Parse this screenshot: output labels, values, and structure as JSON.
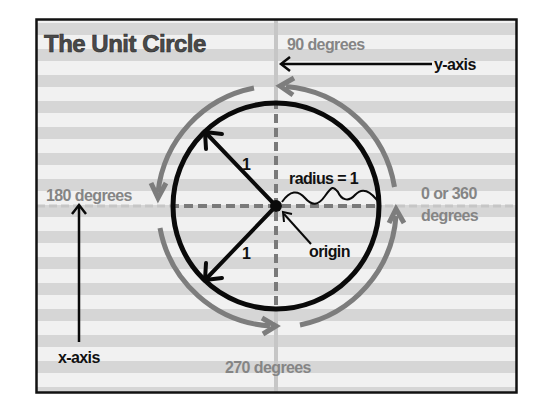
{
  "title": "The Unit Circle",
  "labels": {
    "deg90": "90 degrees",
    "deg180": "180 degrees",
    "deg270": "270 degrees",
    "deg0_line1": "0 or 360",
    "deg0_line2": "degrees",
    "y_axis": "y-axis",
    "x_axis": "x-axis",
    "radius": "radius = 1",
    "origin": "origin",
    "radius_value_upper": "1",
    "radius_value_lower": "1"
  },
  "colors": {
    "stripe_light": "#f1f1f1",
    "stripe_dark": "#d6d6d6",
    "frame": "#111111",
    "circle": "#0a0a0a",
    "gray_arc": "#7d7d7d",
    "gray_text": "#858585",
    "title_text": "#4a4a4a",
    "axis_inner_dash": "#7a7a7a",
    "axis_outer": "#c4c4c4"
  },
  "diagram": {
    "unit_radius": 1,
    "radius_arrow_angles_deg": [
      135,
      225
    ],
    "rotation_direction": "counterclockwise",
    "angle_markers_deg": [
      0,
      90,
      180,
      270,
      360
    ]
  }
}
